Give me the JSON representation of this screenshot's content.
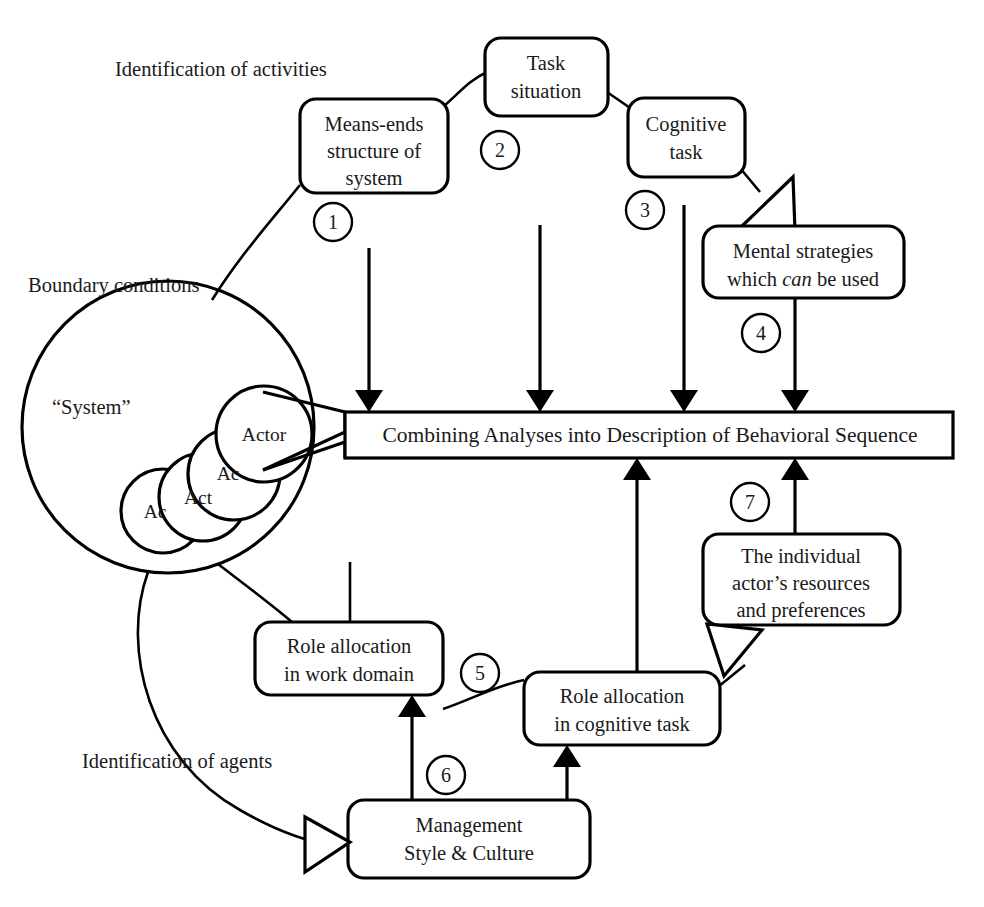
{
  "diagram": {
    "title_labels": {
      "activities": "Identification of activities",
      "boundary": "Boundary conditions",
      "system": "“System”",
      "agents": "Identification of agents"
    },
    "central_bar": {
      "label": "Combining Analyses into Description of Behavioral Sequence"
    },
    "actors": [
      {
        "label": "Actor"
      },
      {
        "label": "Ac"
      },
      {
        "label": "Act"
      },
      {
        "label": "Ac"
      }
    ],
    "nodes": [
      {
        "id": "means-ends",
        "lines": [
          "Means-ends",
          "structure of",
          "system"
        ],
        "number": "1"
      },
      {
        "id": "task-situation",
        "lines": [
          "Task",
          "situation"
        ],
        "number": "2"
      },
      {
        "id": "cognitive-task",
        "lines": [
          "Cognitive",
          "task"
        ],
        "number": "3"
      },
      {
        "id": "mental-strategies",
        "lines": [
          "Mental strategies",
          "which can be used"
        ],
        "number": "4",
        "italic_word": "can"
      },
      {
        "id": "role-work-domain",
        "lines": [
          "Role allocation",
          "in work domain"
        ],
        "number": "5"
      },
      {
        "id": "role-cognitive-task",
        "lines": [
          "Role allocation",
          "in cognitive task"
        ],
        "number": ""
      },
      {
        "id": "management-style",
        "lines": [
          "Management",
          "Style & Culture"
        ],
        "number": "6"
      },
      {
        "id": "individual-actor",
        "lines": [
          "The individual",
          "actor’s resources",
          "and preferences"
        ],
        "number": "7"
      }
    ],
    "numbers": [
      "1",
      "2",
      "3",
      "4",
      "5",
      "6",
      "7"
    ],
    "colors": {
      "stroke": "#000000",
      "fill": "#ffffff",
      "text": "#1a1a1a"
    }
  }
}
